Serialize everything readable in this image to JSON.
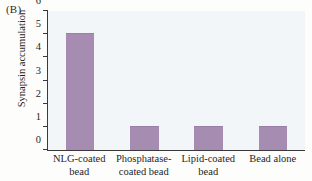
{
  "panel": {
    "label": "(B)"
  },
  "chart_data": {
    "type": "bar",
    "title": "",
    "xlabel": "",
    "ylabel": "Synapsin accumulation",
    "categories": [
      "NLG-coated bead",
      "Phosphatase-coated bead",
      "Lipid-coated bead",
      "Bead alone"
    ],
    "category_lines": [
      [
        "NLG-coated",
        "bead"
      ],
      [
        "Phosphatase-",
        "coated bead"
      ],
      [
        "Lipid-coated",
        "bead"
      ],
      [
        "Bead alone"
      ]
    ],
    "values": [
      5,
      1,
      1,
      1
    ],
    "ylim": [
      0,
      6
    ],
    "yticks": [
      0,
      1,
      2,
      3,
      4,
      5,
      6
    ],
    "grid": false,
    "legend": "none",
    "bar_color": "#a68cb0",
    "plot_background": "#f2f6f8",
    "axis_color": "#3a3a3a"
  }
}
